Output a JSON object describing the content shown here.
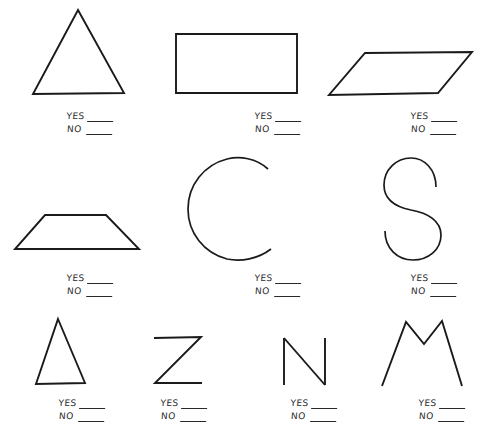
{
  "page": {
    "background_color": "#ffffff",
    "ink_color": "#1a1a1a",
    "width": 490,
    "height": 439
  },
  "answer_labels": {
    "yes": "YES",
    "no": "NO"
  },
  "items": [
    {
      "id": "triangle-equilateral",
      "figure_name": "equilateral-triangle",
      "row": 1,
      "column": 1,
      "answer": {
        "yes": "YES",
        "no": "NO"
      }
    },
    {
      "id": "rectangle",
      "figure_name": "rectangle",
      "row": 1,
      "column": 2,
      "answer": {
        "yes": "YES",
        "no": "NO"
      }
    },
    {
      "id": "parallelogram",
      "figure_name": "parallelogram",
      "row": 1,
      "column": 3,
      "answer": {
        "yes": "YES",
        "no": "NO"
      }
    },
    {
      "id": "trapezoid",
      "figure_name": "trapezoid",
      "row": 2,
      "column": 1,
      "answer": {
        "yes": "YES",
        "no": "NO"
      }
    },
    {
      "id": "letter-c",
      "figure_name": "letter-c",
      "row": 2,
      "column": 2,
      "answer": {
        "yes": "YES",
        "no": "NO"
      }
    },
    {
      "id": "letter-s",
      "figure_name": "letter-s",
      "row": 2,
      "column": 3,
      "answer": {
        "yes": "YES",
        "no": "NO"
      }
    },
    {
      "id": "triangle-narrow",
      "figure_name": "narrow-triangle",
      "row": 3,
      "column": 1,
      "answer": {
        "yes": "YES",
        "no": "NO"
      }
    },
    {
      "id": "letter-z",
      "figure_name": "letter-z",
      "row": 3,
      "column": 2,
      "answer": {
        "yes": "YES",
        "no": "NO"
      }
    },
    {
      "id": "letter-n",
      "figure_name": "letter-n",
      "row": 3,
      "column": 3,
      "answer": {
        "yes": "YES",
        "no": "NO"
      }
    },
    {
      "id": "letter-m",
      "figure_name": "letter-m",
      "row": 3,
      "column": 4,
      "answer": {
        "yes": "YES",
        "no": "NO"
      }
    }
  ]
}
